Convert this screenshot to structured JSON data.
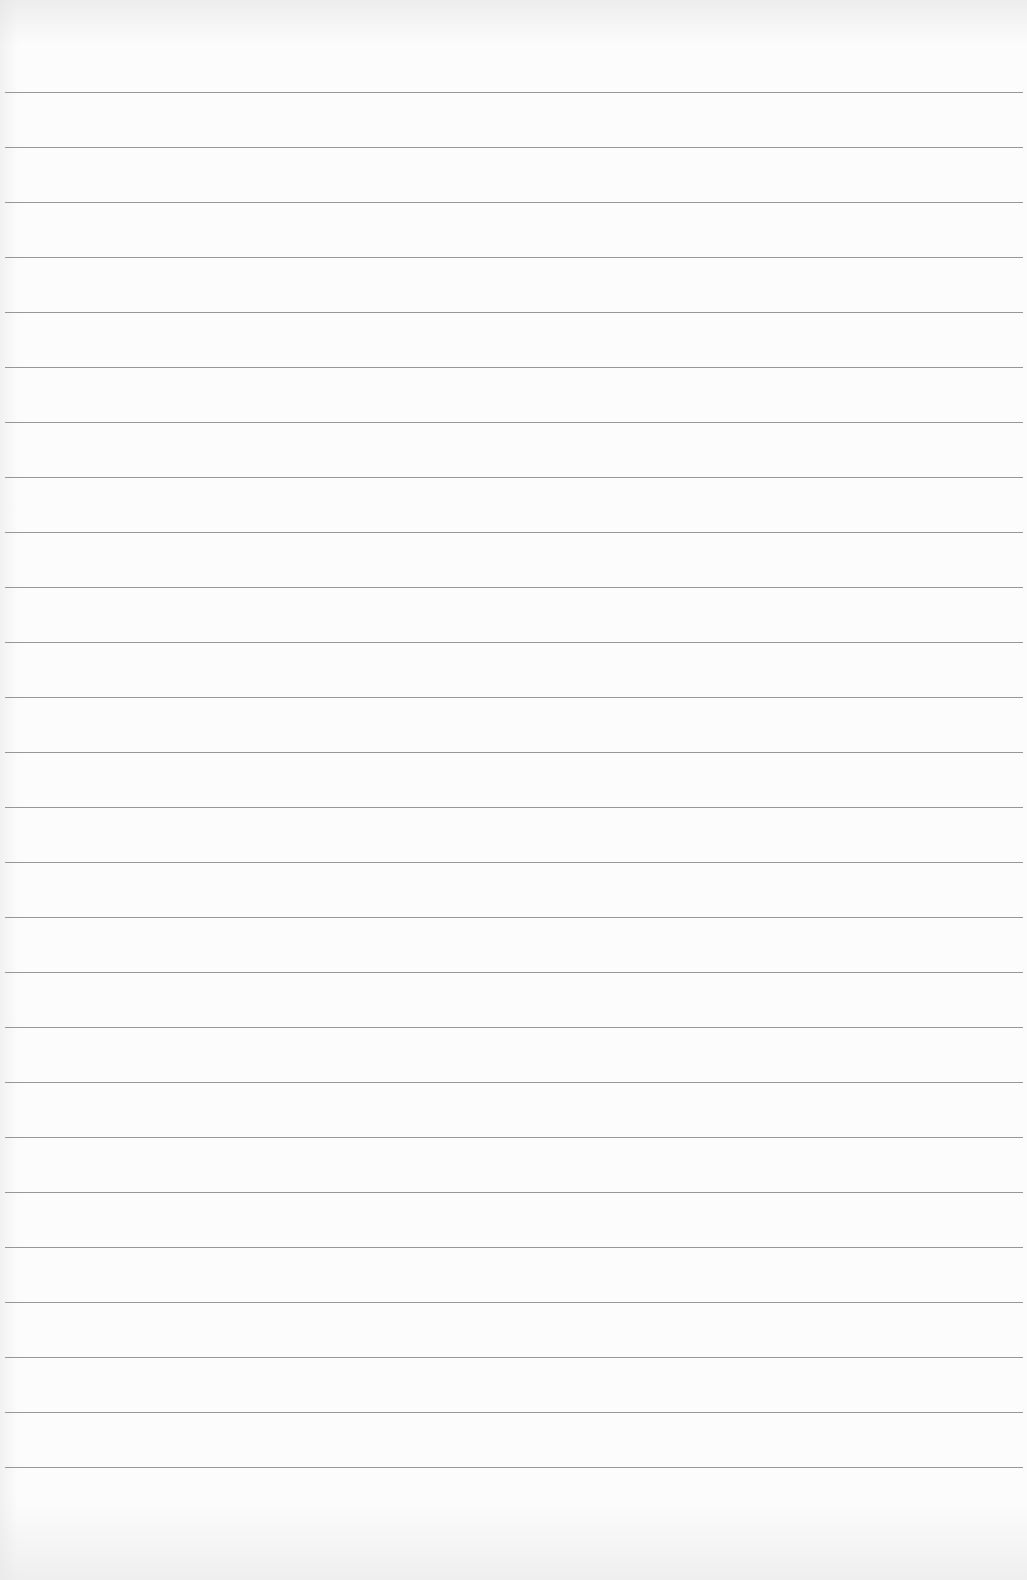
{
  "document": {
    "type": "lined-paper",
    "background_color": "#fcfcfc",
    "rule_color": "#8c8c8c",
    "rule_count": 26,
    "first_rule_y": 92,
    "rule_spacing_px": 55,
    "text": ""
  }
}
